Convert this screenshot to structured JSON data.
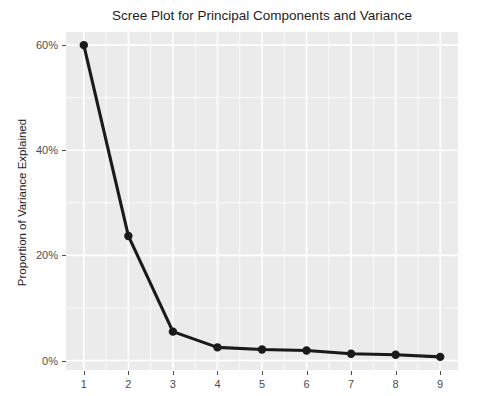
{
  "chart_data": {
    "type": "line",
    "title": "Scree Plot for Principal Components and Variance",
    "xlabel": "",
    "ylabel": "Proportion of Variance Explained",
    "x": [
      1,
      2,
      3,
      4,
      5,
      6,
      7,
      8,
      9
    ],
    "values": [
      60.0,
      23.7,
      5.5,
      2.5,
      2.1,
      1.9,
      1.3,
      1.1,
      0.7
    ],
    "x_tick_labels": [
      "1",
      "2",
      "3",
      "4",
      "5",
      "6",
      "7",
      "8",
      "9"
    ],
    "y_tick_labels": [
      "0%",
      "20%",
      "40%",
      "60%"
    ],
    "y_tick_values": [
      0,
      20,
      40,
      60
    ],
    "xlim": [
      0.6,
      9.4
    ],
    "ylim": [
      -1.8,
      62.5
    ],
    "grid": true,
    "legend": null,
    "series_color": "#1a1a1a",
    "panel_background": "#ebebeb",
    "gridline_color": "#ffffff",
    "point_shape": "circle",
    "marker_size": 4.2,
    "line_width": 3.1
  }
}
